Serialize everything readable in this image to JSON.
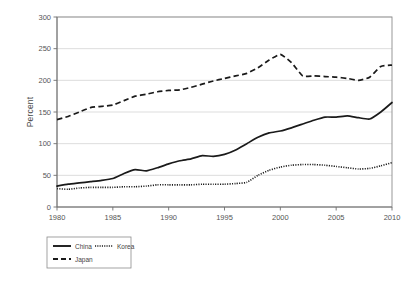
{
  "chart_data": {
    "type": "line",
    "title": "",
    "subtitle": "",
    "xlabel": "",
    "ylabel": "Percent",
    "xlim": [
      1980,
      2010
    ],
    "ylim": [
      0,
      300
    ],
    "ytick_labels": [
      "0",
      "50",
      "100",
      "150",
      "200",
      "250",
      "300"
    ],
    "ytick_values": [
      0,
      50,
      100,
      150,
      200,
      250,
      300
    ],
    "xtick_labels": [
      "1980",
      "1985",
      "1990",
      "1995",
      "2000",
      "2005",
      "2010"
    ],
    "xtick_values": [
      1980,
      1985,
      1990,
      1995,
      2000,
      2005,
      2010
    ],
    "grid": "horizontal",
    "legend_position": "below-left",
    "x": [
      1980,
      1981,
      1982,
      1983,
      1984,
      1985,
      1986,
      1987,
      1988,
      1989,
      1990,
      1991,
      1992,
      1993,
      1994,
      1995,
      1996,
      1997,
      1998,
      1999,
      2000,
      2001,
      2002,
      2003,
      2004,
      2005,
      2006,
      2007,
      2008,
      2009,
      2010
    ],
    "series": [
      {
        "name": "China",
        "style": "solid",
        "color": "#1a1a1a",
        "values": [
          33,
          36,
          38,
          40,
          42,
          45,
          53,
          59,
          57,
          62,
          68,
          73,
          76,
          81,
          80,
          83,
          90,
          100,
          110,
          117,
          120,
          125,
          131,
          137,
          142,
          142,
          144,
          141,
          139,
          150,
          165
        ]
      },
      {
        "name": "Korea",
        "style": "dotted",
        "color": "#1a1a1a",
        "values": [
          29,
          28,
          30,
          31,
          31,
          31,
          32,
          32,
          33,
          35,
          35,
          35,
          35,
          36,
          36,
          36,
          37,
          39,
          50,
          58,
          63,
          66,
          67,
          67,
          66,
          64,
          62,
          60,
          61,
          65,
          70
        ]
      },
      {
        "name": "Japan",
        "style": "dashed",
        "color": "#1a1a1a",
        "values": [
          138,
          143,
          150,
          157,
          159,
          161,
          168,
          175,
          178,
          182,
          184,
          185,
          189,
          194,
          199,
          203,
          207,
          211,
          220,
          232,
          241,
          228,
          207,
          207,
          206,
          205,
          203,
          200,
          205,
          222,
          224
        ]
      }
    ]
  },
  "legend": {
    "entries": [
      {
        "label": "China",
        "style": "solid"
      },
      {
        "label": "Korea",
        "style": "dotted"
      },
      {
        "label": "Japan",
        "style": "dashed"
      }
    ]
  }
}
